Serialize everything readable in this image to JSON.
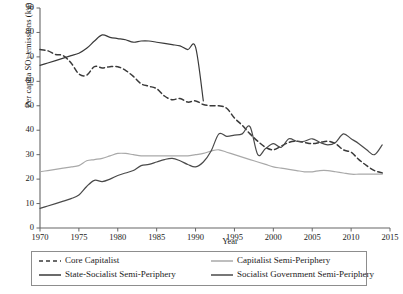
{
  "chart_data": {
    "type": "line",
    "title": "",
    "xlabel": "Year",
    "ylabel": "Per capita SO2 emissions (kg)",
    "ylabel_main": "Per capita SO",
    "ylabel_sub": "2",
    "ylabel_tail": " emissions (kg)",
    "xlim": [
      1970,
      2015
    ],
    "ylim": [
      0,
      90
    ],
    "xticks": [
      1970,
      1975,
      1980,
      1985,
      1990,
      1995,
      2000,
      2005,
      2010,
      2015
    ],
    "yticks": [
      0,
      10,
      20,
      30,
      40,
      50,
      60,
      70,
      80,
      90
    ],
    "grid": false,
    "legend_position": "below-plot",
    "series": [
      {
        "name": "Core Capitalist",
        "style": "dashed",
        "color": "#3a3a3a",
        "x": [
          1970,
          1971,
          1972,
          1973,
          1974,
          1975,
          1976,
          1977,
          1978,
          1979,
          1980,
          1981,
          1982,
          1983,
          1984,
          1985,
          1986,
          1987,
          1988,
          1989,
          1990,
          1991,
          1992,
          1993,
          1994,
          1995,
          1996,
          1997,
          1998,
          1999,
          2000,
          2001,
          2002,
          2003,
          2004,
          2005,
          2006,
          2007,
          2008,
          2009,
          2010,
          2011,
          2012,
          2013,
          2014
        ],
        "y": [
          73.0,
          72.5,
          71.0,
          70.5,
          67.5,
          63.0,
          62.5,
          66.0,
          65.5,
          66.0,
          66.0,
          64.5,
          62.0,
          59.0,
          58.0,
          57.0,
          54.0,
          52.5,
          53.0,
          51.5,
          52.0,
          50.5,
          50.0,
          50.0,
          49.0,
          45.0,
          42.0,
          38.5,
          35.5,
          33.0,
          32.0,
          33.5,
          35.0,
          35.5,
          35.0,
          34.5,
          35.0,
          35.5,
          34.5,
          32.0,
          31.0,
          28.0,
          25.5,
          23.5,
          22.5
        ]
      },
      {
        "name": "State-Socialist Semi-Periphery",
        "style": "solid",
        "color": "#3a3a3a",
        "x": [
          1970,
          1971,
          1972,
          1973,
          1974,
          1975,
          1976,
          1977,
          1978,
          1979,
          1980,
          1981,
          1982,
          1983,
          1984,
          1985,
          1986,
          1987,
          1988,
          1989,
          1990,
          1991
        ],
        "y": [
          66.5,
          67.5,
          68.5,
          69.5,
          70.5,
          71.5,
          73.5,
          76.5,
          79.0,
          78.0,
          77.5,
          77.0,
          76.0,
          76.5,
          76.5,
          76.0,
          75.5,
          75.0,
          74.5,
          73.0,
          74.0,
          52.0
        ]
      },
      {
        "name": "Capitalist Semi-Periphery",
        "style": "solid",
        "color": "#a9a9a9",
        "x": [
          1970,
          1971,
          1972,
          1973,
          1974,
          1975,
          1976,
          1977,
          1978,
          1979,
          1980,
          1981,
          1982,
          1983,
          1984,
          1985,
          1986,
          1987,
          1988,
          1989,
          1990,
          1991,
          1992,
          1993,
          1994,
          1995,
          1996,
          1997,
          1998,
          1999,
          2000,
          2001,
          2002,
          2003,
          2004,
          2005,
          2006,
          2007,
          2008,
          2009,
          2010,
          2011,
          2012,
          2013,
          2014
        ],
        "y": [
          23.0,
          23.5,
          24.0,
          24.5,
          25.0,
          25.5,
          27.5,
          28.0,
          28.5,
          29.5,
          30.5,
          30.5,
          30.0,
          29.5,
          29.5,
          29.5,
          29.5,
          29.5,
          29.5,
          29.5,
          30.0,
          30.5,
          31.5,
          32.0,
          31.0,
          30.0,
          29.0,
          28.0,
          27.0,
          26.0,
          25.0,
          24.5,
          24.0,
          23.5,
          23.0,
          23.0,
          23.5,
          23.5,
          23.0,
          22.5,
          22.0,
          22.0,
          22.0,
          22.0,
          22.0
        ]
      },
      {
        "name": "Socialist Government Semi-Periphery",
        "style": "solid",
        "color": "#4a4a4a",
        "x": [
          1970,
          1971,
          1972,
          1973,
          1974,
          1975,
          1976,
          1977,
          1978,
          1979,
          1980,
          1981,
          1982,
          1983,
          1984,
          1985,
          1986,
          1987,
          1988,
          1989,
          1990,
          1991,
          1992,
          1993,
          1994,
          1995,
          1996,
          1997,
          1998,
          1999,
          2000,
          2001,
          2002,
          2003,
          2004,
          2005,
          2006,
          2007,
          2008,
          2009,
          2010,
          2011,
          2012,
          2013,
          2014
        ],
        "y": [
          8.0,
          9.0,
          10.0,
          11.0,
          12.0,
          13.5,
          17.0,
          19.5,
          19.0,
          20.0,
          21.5,
          22.5,
          23.5,
          25.5,
          26.0,
          27.0,
          28.0,
          28.5,
          27.5,
          26.0,
          25.0,
          27.0,
          31.5,
          38.5,
          37.5,
          38.0,
          38.5,
          41.5,
          30.0,
          32.5,
          34.5,
          33.0,
          36.5,
          35.5,
          35.5,
          36.5,
          35.0,
          34.0,
          35.0,
          38.5,
          36.5,
          34.5,
          32.0,
          30.0,
          34.0
        ]
      }
    ]
  },
  "axis": {
    "ylabel_full": "Per capita SO2 emissions (kg)",
    "xlabel": "Year",
    "ytick_labels": [
      "0",
      "10",
      "20",
      "30",
      "40",
      "50",
      "60",
      "70",
      "80",
      "90"
    ],
    "xtick_labels": [
      "1970",
      "1975",
      "1980",
      "1985",
      "1990",
      "1995",
      "2000",
      "2005",
      "2010",
      "2015"
    ]
  },
  "legend": {
    "items": [
      {
        "label": "Core Capitalist",
        "style": "dashed",
        "color": "#3a3a3a"
      },
      {
        "label": "State-Socialist Semi-Periphery",
        "style": "solid",
        "color": "#3a3a3a"
      },
      {
        "label": "Capitalist Semi-Periphery",
        "style": "solid",
        "color": "#a9a9a9"
      },
      {
        "label": "Socialist Government Semi-Periphery",
        "style": "solid",
        "color": "#4a4a4a"
      }
    ]
  }
}
